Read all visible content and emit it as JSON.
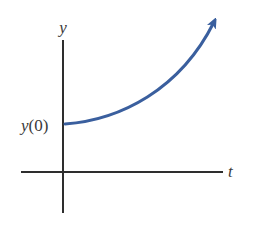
{
  "diagram": {
    "title": "",
    "axes": {
      "x_label": "t",
      "y_label": "y"
    },
    "annotations": {
      "y_intercept_label_var": "y",
      "y_intercept_label_arg": "(0)"
    },
    "curve": {
      "description": "exponential growth starting at y(0), rising with arrow",
      "color": "#3a5f9e",
      "type": "exponential-growth",
      "has_arrowhead": true
    },
    "colors": {
      "axis": "#2e2e2e",
      "curve": "#3a5f9e",
      "text": "#3a3a3a"
    }
  }
}
